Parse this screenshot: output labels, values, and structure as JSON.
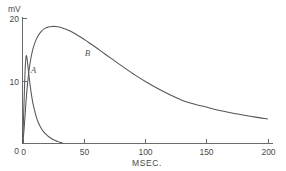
{
  "chart_data": {
    "type": "line",
    "title": "",
    "subtitle": "",
    "xlabel": "MSEC.",
    "ylabel": "mV",
    "ylabel_position": "above-axis-top",
    "xlim": [
      0,
      200
    ],
    "ylim": [
      0,
      20
    ],
    "xticks": [
      0,
      50,
      100,
      150,
      200
    ],
    "xticklabels": [
      "0",
      "50",
      "100",
      "150",
      "200"
    ],
    "yticks": [
      0,
      10,
      20
    ],
    "yticklabels": [
      "0",
      "10",
      "20"
    ],
    "grid": false,
    "legend": "none",
    "axis_style": "left-and-bottom-spines",
    "line_color": "#55555a",
    "axis_color": "#6b6b6b",
    "background_color": "#ffffff",
    "annotations": [
      {
        "text": "A",
        "x": 9,
        "y": 11.2,
        "style": "italic"
      },
      {
        "text": "B",
        "x": 53,
        "y": 13.9,
        "style": "italic"
      }
    ],
    "series": [
      {
        "name": "A",
        "label": "A",
        "description": "fast narrow spike rising steeply from baseline, peaking near 14 mV at about 3 ms, then decaying to baseline by about 32 ms",
        "x": [
          0.0,
          0.6,
          1.2,
          1.8,
          2.3,
          2.8,
          3.2,
          3.8,
          4.5,
          5.3,
          6.2,
          7.2,
          8.4,
          9.8,
          11.3,
          13.0,
          15.0,
          17.2,
          19.5,
          22.0,
          24.5,
          27.0,
          29.0,
          30.5,
          31.5,
          32.2
        ],
        "y": [
          0.0,
          2.6,
          6.2,
          9.8,
          12.4,
          13.7,
          14.0,
          13.4,
          12.2,
          10.8,
          9.3,
          7.9,
          6.5,
          5.3,
          4.2,
          3.3,
          2.5,
          1.9,
          1.4,
          1.0,
          0.68,
          0.45,
          0.3,
          0.2,
          0.14,
          0.1
        ]
      },
      {
        "name": "B",
        "label": "B",
        "description": "broad slow wave rising from baseline, rounded peak near 18.6 mV at about 28 ms, then long gradual decay to about 3.9 mV at 200 ms",
        "x": [
          0.0,
          1.0,
          2.0,
          3.0,
          4.5,
          6.0,
          8.0,
          10.0,
          12.5,
          15.0,
          18.0,
          21.0,
          24.0,
          27.0,
          30.0,
          34.0,
          38.0,
          43.0,
          48.0,
          54.0,
          60.0,
          67.0,
          75.0,
          83.0,
          92.0,
          101.0,
          110.0,
          120.0,
          130.0,
          140.0,
          150.0,
          160.0,
          170.0,
          180.0,
          190.0,
          200.0
        ],
        "y": [
          0.0,
          1.6,
          4.2,
          7.0,
          10.3,
          12.6,
          14.7,
          16.0,
          17.1,
          17.8,
          18.3,
          18.55,
          18.65,
          18.65,
          18.55,
          18.3,
          18.0,
          17.5,
          16.9,
          16.1,
          15.3,
          14.3,
          13.2,
          12.1,
          10.9,
          9.8,
          8.8,
          7.8,
          6.9,
          6.3,
          5.8,
          5.3,
          4.9,
          4.55,
          4.2,
          3.9
        ]
      }
    ]
  },
  "axes": {
    "y_unit": "mV",
    "x_title": "MSEC."
  }
}
